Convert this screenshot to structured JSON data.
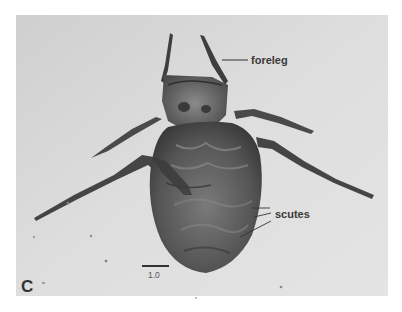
{
  "figure": {
    "panel_label": "C",
    "annotations": {
      "foreleg": "foreleg",
      "scutes": "scutes"
    },
    "scale_bar": {
      "label": "1.0"
    },
    "colors": {
      "page_background": "#ffffff",
      "matrix": "#d9d9d9",
      "specimen_dark": "#3e3e3e",
      "specimen_mid": "#6a6a6a",
      "leader_line": "#333333"
    }
  }
}
